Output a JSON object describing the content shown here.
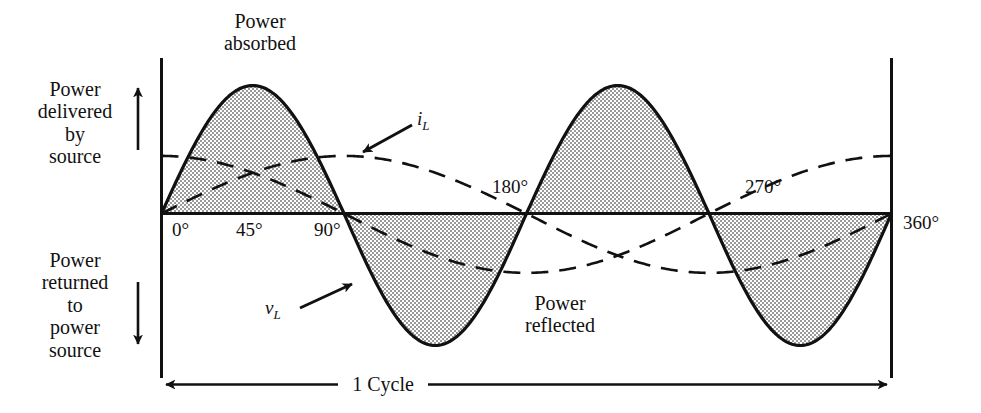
{
  "figure": {
    "title_top": "Power\nabsorbed",
    "label_up": "Power\ndelivered\nby\nsource",
    "label_down": "Power\nreturned\nto\npower\nsource",
    "label_reflected": "Power\nreflected",
    "cycle_label": "1 Cycle",
    "curve_label_v": "v",
    "curve_label_v_sub": "L",
    "curve_label_i": "i",
    "curve_label_i_sub": "L",
    "up_arrow_icon": "up-arrow",
    "down_arrow_icon": "down-arrow",
    "span_arrow_icon": "double-headed-arrow"
  },
  "colors": {
    "ink": "#111111",
    "shade": "#b4b4b4",
    "shade_light": "#c9c9c9",
    "background": "#ffffff"
  },
  "chart_data": {
    "type": "line",
    "title": "Power absorbed",
    "xlabel": "",
    "ylabel": "",
    "xlim": [
      0,
      360
    ],
    "ylim": [
      -1.03,
      1.0
    ],
    "grid": false,
    "legend": "inline-annotations",
    "xticks": [
      0,
      45,
      90,
      180,
      270,
      360
    ],
    "xticklabels": [
      "0°",
      "45°",
      "90°",
      "180°",
      "270°",
      "360°"
    ],
    "annotations": [
      {
        "text": "Power absorbed",
        "x": 50,
        "y": 1.0
      },
      {
        "text": "Power reflected",
        "x": 225,
        "y": -0.62
      },
      {
        "text": "i_L",
        "x": 150,
        "y": 0.48
      },
      {
        "text": "v_L",
        "x": 78,
        "y": -0.52
      },
      {
        "text": "1 Cycle",
        "x": 180,
        "y": -1.25
      }
    ],
    "series": [
      {
        "name": "p = v_L i_L (instantaneous power)",
        "style": "solid",
        "shaded": true,
        "shade_meaning": {
          "positive": "Power absorbed",
          "negative": "Power reflected"
        },
        "formula": "sin(2x)",
        "period_deg": 180,
        "amplitude": 1.0,
        "phase_deg": 0,
        "key_points": [
          {
            "x": 0,
            "y": 0
          },
          {
            "x": 45,
            "y": 1.0
          },
          {
            "x": 90,
            "y": 0
          },
          {
            "x": 135,
            "y": -1.0
          },
          {
            "x": 180,
            "y": 0
          },
          {
            "x": 225,
            "y": 1.0
          },
          {
            "x": 270,
            "y": 0
          },
          {
            "x": 315,
            "y": -1.0
          },
          {
            "x": 360,
            "y": 0
          }
        ]
      },
      {
        "name": "i_L",
        "style": "dashed",
        "shaded": false,
        "formula": "0.45 cos(x)",
        "period_deg": 360,
        "amplitude": 0.45,
        "phase_deg": 90,
        "key_points": [
          {
            "x": 0,
            "y": 0.45
          },
          {
            "x": 90,
            "y": 0
          },
          {
            "x": 180,
            "y": -0.45
          },
          {
            "x": 270,
            "y": 0
          },
          {
            "x": 360,
            "y": 0.45
          }
        ]
      },
      {
        "name": "v_L",
        "style": "dashed",
        "shaded": false,
        "formula": "0.45 sin(x)",
        "period_deg": 360,
        "amplitude": 0.45,
        "phase_deg": 0,
        "key_points": [
          {
            "x": 0,
            "y": 0
          },
          {
            "x": 90,
            "y": 0.45
          },
          {
            "x": 180,
            "y": 0
          },
          {
            "x": 270,
            "y": -0.45
          },
          {
            "x": 360,
            "y": 0
          }
        ]
      }
    ]
  }
}
